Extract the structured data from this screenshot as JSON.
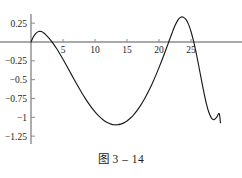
{
  "figure": {
    "caption": "图 3 – 14",
    "top_text_fragment": "",
    "axis_color": "#8c8c8c",
    "curve_color": "#1a1a1a",
    "text_color": "#1a1a1a"
  },
  "chart_data": {
    "type": "line",
    "title": "",
    "subtitle": "",
    "xlabel": "",
    "ylabel": "",
    "grid": false,
    "legend": null,
    "xlim": [
      -0.6,
      30.0
    ],
    "ylim": [
      -1.38,
      0.42
    ],
    "xticks": [
      5,
      10,
      15,
      20,
      25
    ],
    "xtick_labels": [
      "5",
      "10",
      "15",
      "20",
      "25"
    ],
    "yticks": [
      0.25,
      -0.25,
      -0.5,
      -0.75,
      -1,
      -1.25
    ],
    "ytick_labels": [
      "0.25",
      "-0.25",
      "-0.5",
      "-0.75",
      "-1",
      "-1.25"
    ],
    "annotations": [],
    "series": [
      {
        "name": "curve",
        "x": [
          0.0,
          0.4,
          0.8,
          1.2,
          1.6,
          1.9,
          2.3,
          2.7,
          3.1,
          3.5,
          4.0,
          4.5,
          5.0,
          5.5,
          6.0,
          6.5,
          7.0,
          7.5,
          8.0,
          8.5,
          9.0,
          9.5,
          10.0,
          10.5,
          11.0,
          11.5,
          12.0,
          12.5,
          13.0,
          13.5,
          14.0,
          14.5,
          15.0,
          15.5,
          16.0,
          16.5,
          17.0,
          17.5,
          18.0,
          18.5,
          19.0,
          19.5,
          20.0,
          20.5,
          21.0,
          21.5,
          22.0,
          22.5,
          23.0,
          23.4,
          23.8,
          24.2,
          24.6,
          25.0,
          25.4,
          25.8,
          26.2,
          26.6,
          27.0,
          27.4,
          27.8,
          28.2,
          28.6,
          29.0,
          29.4,
          29.6
        ],
        "y": [
          0.0,
          0.072,
          0.118,
          0.139,
          0.139,
          0.126,
          0.099,
          0.063,
          0.022,
          -0.024,
          -0.087,
          -0.156,
          -0.229,
          -0.305,
          -0.383,
          -0.46,
          -0.537,
          -0.612,
          -0.684,
          -0.752,
          -0.816,
          -0.875,
          -0.928,
          -0.975,
          -1.015,
          -1.048,
          -1.073,
          -1.09,
          -1.099,
          -1.099,
          -1.091,
          -1.074,
          -1.048,
          -1.013,
          -0.97,
          -0.918,
          -0.858,
          -0.79,
          -0.714,
          -0.631,
          -0.54,
          -0.443,
          -0.34,
          -0.232,
          -0.12,
          -0.005,
          0.11,
          0.218,
          0.298,
          0.33,
          0.33,
          0.3,
          0.237,
          0.14,
          0.012,
          -0.142,
          -0.312,
          -0.49,
          -0.663,
          -0.817,
          -0.937,
          -1.01,
          -1.03,
          -1.0,
          -0.95,
          -1.07
        ]
      }
    ]
  }
}
